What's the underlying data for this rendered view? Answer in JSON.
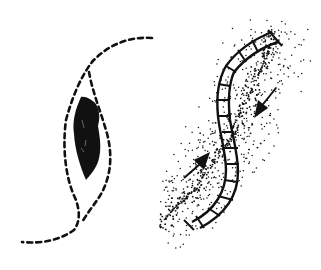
{
  "figure": {
    "panels": [
      {
        "id": "left",
        "label": "open-wound",
        "elements": [
          "dashed-outer-outline",
          "dashed-inner-outline",
          "dark-wound-fill"
        ]
      },
      {
        "id": "right",
        "label": "sutured-wound",
        "elements": [
          "s-curve-suture-line",
          "cross-stitches",
          "stippled-tissue",
          "contraction-arrow-upper",
          "contraction-arrow-lower"
        ]
      }
    ],
    "colors": {
      "ink": "#111111",
      "background": "#ffffff"
    }
  }
}
